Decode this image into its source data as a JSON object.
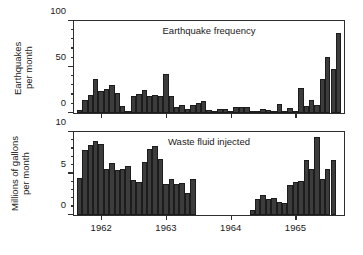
{
  "figure": {
    "background": "#ffffff",
    "bar_color": "#3c3c3c",
    "axis_color": "#2e2e2e"
  },
  "chart_data": [
    {
      "type": "bar",
      "id": "earthquake-frequency",
      "title": "Earthquake frequency",
      "xlabel": "",
      "ylabel": "Earthquakes\nper month",
      "ylabel_line1": "Earthquakes",
      "ylabel_line2": "per month",
      "ylim": [
        0,
        100
      ],
      "yticks": [
        0,
        50,
        100
      ],
      "ytick_labels": [
        "0",
        "50",
        "100"
      ],
      "yminor_step": 10,
      "grid": false,
      "xlim": [
        1961.58,
        1965.75
      ],
      "xticks": [
        1962,
        1963,
        1964,
        1965
      ],
      "xtick_labels": [
        "1962",
        "1963",
        "1964",
        "1965"
      ],
      "bar_width_months": 1,
      "x": [
        1961.625,
        1961.708,
        1961.792,
        1961.875,
        1961.958,
        1962.042,
        1962.125,
        1962.208,
        1962.292,
        1962.375,
        1962.458,
        1962.542,
        1962.625,
        1962.708,
        1962.792,
        1962.875,
        1962.958,
        1963.042,
        1963.125,
        1963.208,
        1963.292,
        1963.375,
        1963.458,
        1963.542,
        1963.625,
        1963.708,
        1963.792,
        1963.875,
        1963.958,
        1964.042,
        1964.125,
        1964.208,
        1964.292,
        1964.375,
        1964.458,
        1964.542,
        1964.625,
        1964.708,
        1964.792,
        1964.875,
        1964.958,
        1965.042,
        1965.125,
        1965.208,
        1965.292,
        1965.375,
        1965.458,
        1965.542,
        1965.625
      ],
      "values": [
        3,
        14,
        20,
        37,
        24,
        26,
        30,
        22,
        8,
        2,
        18,
        21,
        25,
        19,
        20,
        19,
        42,
        19,
        6,
        9,
        4,
        9,
        11,
        13,
        3,
        2,
        4,
        4,
        2,
        7,
        7,
        6,
        2,
        2,
        4,
        3,
        1,
        10,
        2,
        5,
        1,
        27,
        8,
        14,
        9,
        37,
        61,
        48,
        87
      ],
      "final_value": 3
    },
    {
      "type": "bar",
      "id": "waste-fluid-injected",
      "title": "Waste fluid injected",
      "xlabel": "",
      "ylabel": "Millions of gallons\nper month",
      "ylabel_line1": "Millions of gallons",
      "ylabel_line2": "per month",
      "ylim": [
        0,
        10
      ],
      "yticks": [
        0,
        5,
        10
      ],
      "ytick_labels": [
        "0",
        "5",
        "10"
      ],
      "yminor_step": 1,
      "grid": false,
      "xlim": [
        1961.58,
        1965.75
      ],
      "xticks": [
        1962,
        1963,
        1964,
        1965
      ],
      "xtick_labels": [
        "1962",
        "1963",
        "1964",
        "1965"
      ],
      "bar_width_months": 1,
      "note": "Injection halted between early 1963 and mid 1964",
      "x": [
        1961.625,
        1961.708,
        1961.792,
        1961.875,
        1961.958,
        1962.042,
        1962.125,
        1962.208,
        1962.292,
        1962.375,
        1962.458,
        1962.542,
        1962.625,
        1962.708,
        1962.792,
        1962.875,
        1962.958,
        1963.042,
        1963.125,
        1963.208,
        1963.292,
        1963.375,
        1964.292,
        1964.375,
        1964.458,
        1964.542,
        1964.625,
        1964.708,
        1964.792,
        1964.875,
        1964.958,
        1965.042,
        1965.125,
        1965.208,
        1965.292,
        1965.375,
        1965.458,
        1965.542
      ],
      "values": [
        4.5,
        7.8,
        8.4,
        8.9,
        8.5,
        5.6,
        6.3,
        5.4,
        5.5,
        5.9,
        4.2,
        4.0,
        6.4,
        8.0,
        8.3,
        6.7,
        3.7,
        4.3,
        3.7,
        3.8,
        2.6,
        4.3,
        0.6,
        1.9,
        2.4,
        1.9,
        2.0,
        1.6,
        1.4,
        3.6,
        4.0,
        4.1,
        6.6,
        5.6,
        9.4,
        4.3,
        5.6,
        6.6
      ]
    }
  ]
}
